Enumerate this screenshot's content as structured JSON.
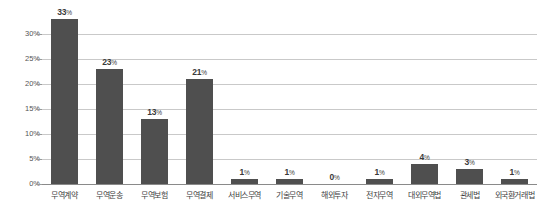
{
  "chart_data": {
    "type": "bar",
    "title": "",
    "subtitle": "",
    "xlabel": "",
    "ylabel": "",
    "ylim": [
      0,
      33
    ],
    "grid": true,
    "legend": false,
    "legend_position": "none",
    "value_label_suffix": "%",
    "bar_color": "#4f4f4f",
    "grid_color": "#c9c9c9",
    "axis_color": "#8a8a8a",
    "background_color": "#ffffff",
    "yticks": [
      {
        "value": 0,
        "label": "0%"
      },
      {
        "value": 5,
        "label": "5%"
      },
      {
        "value": 10,
        "label": "10%"
      },
      {
        "value": 15,
        "label": "15%"
      },
      {
        "value": 20,
        "label": "20%"
      },
      {
        "value": 25,
        "label": "25%"
      },
      {
        "value": 30,
        "label": "30%"
      }
    ],
    "categories": [
      "무역계약",
      "무역운송",
      "무역보험",
      "무역결제",
      "서비스무역",
      "기술무역",
      "해외투자",
      "전자무역",
      "대외무역법",
      "관세법",
      "외국환거래법"
    ],
    "values": [
      33,
      23,
      13,
      21,
      1,
      1,
      0,
      1,
      4,
      3,
      1
    ],
    "value_labels": [
      "33",
      "23",
      "13",
      "21",
      "1",
      "1",
      "0",
      "1",
      "4",
      "3",
      "1"
    ],
    "bars": [
      {
        "category": "무역계약",
        "value": 33,
        "label": "33",
        "suffix": "%"
      },
      {
        "category": "무역운송",
        "value": 23,
        "label": "23",
        "suffix": "%"
      },
      {
        "category": "무역보험",
        "value": 13,
        "label": "13",
        "suffix": "%"
      },
      {
        "category": "무역결제",
        "value": 21,
        "label": "21",
        "suffix": "%"
      },
      {
        "category": "서비스무역",
        "value": 1,
        "label": "1",
        "suffix": "%"
      },
      {
        "category": "기술무역",
        "value": 1,
        "label": "1",
        "suffix": "%"
      },
      {
        "category": "해외투자",
        "value": 0,
        "label": "0",
        "suffix": "%"
      },
      {
        "category": "전자무역",
        "value": 1,
        "label": "1",
        "suffix": "%"
      },
      {
        "category": "대외무역법",
        "value": 4,
        "label": "4",
        "suffix": "%"
      },
      {
        "category": "관세법",
        "value": 3,
        "label": "3",
        "suffix": "%"
      },
      {
        "category": "외국환거래법",
        "value": 1,
        "label": "1",
        "suffix": "%"
      }
    ]
  }
}
